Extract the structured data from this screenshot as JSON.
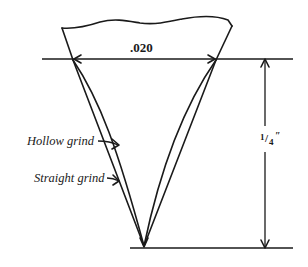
{
  "diagram": {
    "labels": {
      "width_dimension": ".020",
      "height_dimension_numerator": "1",
      "height_dimension_slash": "/",
      "height_dimension_denominator": "4",
      "height_dimension_unit": "″",
      "hollow_grind": "Hollow grind",
      "straight_grind": "Straight grind"
    },
    "colors": {
      "ink": "#1a1a1a",
      "background": "#ffffff"
    }
  }
}
